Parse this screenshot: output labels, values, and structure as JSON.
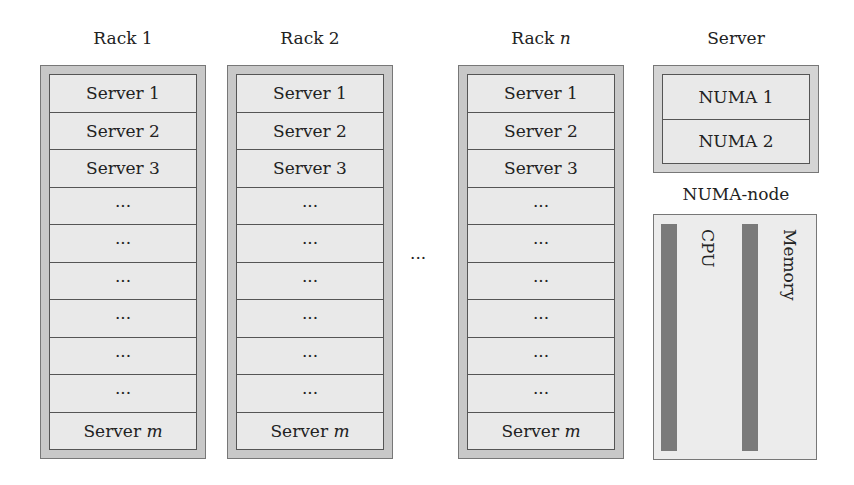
{
  "racks": [
    {
      "title": "Rack 1",
      "slots": [
        "Server 1",
        "Server 2",
        "Server 3",
        "···",
        "···",
        "···",
        "···",
        "···",
        "···",
        "Server m"
      ]
    },
    {
      "title": "Rack 2",
      "slots": [
        "Server 1",
        "Server 2",
        "Server 3",
        "···",
        "···",
        "···",
        "···",
        "···",
        "···",
        "Server m"
      ]
    },
    {
      "title": "Rack n",
      "slots": [
        "Server 1",
        "Server 2",
        "Server 3",
        "···",
        "···",
        "···",
        "···",
        "···",
        "···",
        "Server m"
      ]
    }
  ],
  "between_racks": "···",
  "server": {
    "title": "Server",
    "nodes": [
      "NUMA 1",
      "NUMA 2"
    ]
  },
  "numa_node": {
    "title": "NUMA-node",
    "cpu_label": "CPU",
    "memory_label": "Memory"
  }
}
